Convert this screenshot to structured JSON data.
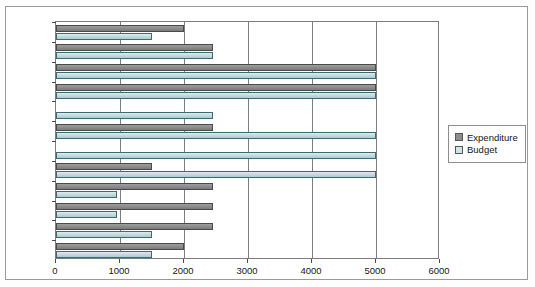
{
  "chart": {
    "type": "bar",
    "orientation": "horizontal",
    "title": "",
    "xlabel": "",
    "ylabel": ""
  },
  "legend": {
    "position": "right",
    "entries": [
      {
        "name": "Expenditure",
        "color": "#8e8e8e",
        "icon": "legend-swatch-icon"
      },
      {
        "name": "Budget",
        "color": "#cfe4e7",
        "icon": "legend-swatch-icon"
      }
    ]
  },
  "axis": {
    "x": {
      "ticks": [
        "0",
        "1000",
        "2000",
        "3000",
        "4000",
        "5000",
        "6000"
      ],
      "min": 0,
      "max": 6000,
      "grid": true
    },
    "y": {
      "categories": [
        "Dec.",
        "Nov.",
        "Oct.",
        "Sep.",
        "Aug.",
        "Jul.",
        "Jun.",
        "May",
        "Apr.",
        "Mar.",
        "Feb.",
        "Jan."
      ],
      "grid": false
    }
  },
  "chart_data": {
    "type": "bar",
    "orientation": "horizontal",
    "title": "",
    "xlabel": "",
    "ylabel": "",
    "categories": [
      "Dec.",
      "Nov.",
      "Oct.",
      "Sep.",
      "Aug.",
      "Jul.",
      "Jun.",
      "May",
      "Apr.",
      "Mar.",
      "Feb.",
      "Jan."
    ],
    "series": [
      {
        "name": "Expenditure",
        "color": "#8e8e8e",
        "values": [
          2000,
          2450,
          5000,
          5000,
          0,
          2450,
          0,
          1500,
          2450,
          2450,
          2450,
          2000
        ]
      },
      {
        "name": "Budget",
        "color": "#cfe4e7",
        "values": [
          1500,
          2450,
          5000,
          5000,
          2450,
          5000,
          5000,
          5000,
          950,
          950,
          1500,
          1500
        ]
      }
    ],
    "xlim": [
      0,
      6000
    ],
    "xticks": [
      0,
      1000,
      2000,
      3000,
      4000,
      5000,
      6000
    ],
    "grid": true,
    "legend_position": "right"
  }
}
